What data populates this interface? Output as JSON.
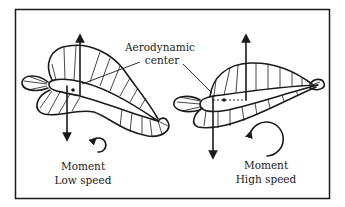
{
  "figure": {
    "labels": {
      "ac_line1": "Aerodynamic",
      "ac_line2": "center",
      "low_moment": "Moment",
      "low_speed": "Low speed",
      "high_moment": "Moment",
      "high_speed": "High speed"
    },
    "panels": [
      {
        "name": "low-speed",
        "caption": "Moment Low speed",
        "moment_direction": "counterclockwise-arrow",
        "size": "small"
      },
      {
        "name": "high-speed",
        "caption": "Moment High speed",
        "moment_direction": "counterclockwise-arrow",
        "size": "large"
      }
    ],
    "colors": {
      "ink": "#1a1a1a",
      "background": "#ffffff"
    }
  }
}
